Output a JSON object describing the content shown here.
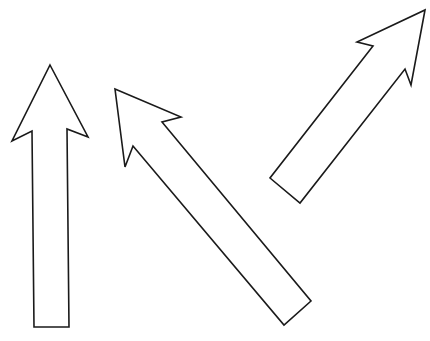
{
  "figure": {
    "background": "#ffffff",
    "stroke_color": "#1a1a1a",
    "top_text_cropped": "",
    "arrows": [
      {
        "name": "vertical-up-arrow",
        "direction": "up",
        "points": "50,65 88,137 67,129 69,327 34,327 32,131 12,141"
      },
      {
        "name": "diagonal-up-left-arrow",
        "direction": "up-left",
        "points": "115,89 181,117 162,122 311,301 284,325 133,146 125,167"
      },
      {
        "name": "diagonal-up-right-arrow",
        "direction": "up-right",
        "points": "425,10 411,85 405,69 300,203 270,178 373,46 357,42"
      }
    ]
  }
}
